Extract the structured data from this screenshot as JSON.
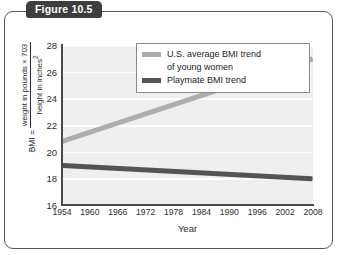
{
  "figure": {
    "tab_label": "Figure 10.5",
    "frame_border_color": "#575757",
    "tab_background_color": "#3d3d3d"
  },
  "chart_data": {
    "type": "line",
    "title": "",
    "xlabel": "Year",
    "ylabel_lead": "BMI =",
    "ylabel_numerator": "weight in pounds × 703",
    "ylabel_denominator": "height in inches",
    "ylabel_denominator_exponent": "2",
    "x": [
      1954,
      1960,
      1966,
      1972,
      1978,
      1984,
      1990,
      1996,
      2002,
      2008
    ],
    "xtick_labels": [
      "1954",
      "1960",
      "1966",
      "1972",
      "1978",
      "1984",
      "1990",
      "1996",
      "2002",
      "2008"
    ],
    "ytick_labels": [
      "28",
      "26",
      "24",
      "22",
      "20",
      "18",
      "16"
    ],
    "yticks": [
      28,
      26,
      24,
      22,
      20,
      18,
      16
    ],
    "xlim": [
      1954,
      2008
    ],
    "ylim": [
      16,
      28
    ],
    "grid": true,
    "legend_position": "top-right",
    "plot_background": "#efefef",
    "gridline_color": "#fdfdfd",
    "series": [
      {
        "name": "U.S. average BMI trend of young women",
        "legend_label_line1": "U.S. average BMI trend",
        "legend_label_line2": "of young women",
        "color": "#adadad",
        "endpoints": [
          {
            "x": 1954,
            "y": 20.8
          },
          {
            "x": 2008,
            "y": 27.0
          }
        ],
        "values": [
          20.8,
          21.5,
          22.2,
          22.9,
          23.5,
          24.2,
          24.9,
          25.6,
          26.3,
          27.0
        ]
      },
      {
        "name": "Playmate BMI trend",
        "legend_label_line1": "Playmate BMI trend",
        "legend_label_line2": "",
        "color": "#545454",
        "endpoints": [
          {
            "x": 1954,
            "y": 19.0
          },
          {
            "x": 2008,
            "y": 18.0
          }
        ],
        "values": [
          19.0,
          18.9,
          18.8,
          18.7,
          18.6,
          18.5,
          18.4,
          18.3,
          18.1,
          18.0
        ]
      }
    ]
  }
}
